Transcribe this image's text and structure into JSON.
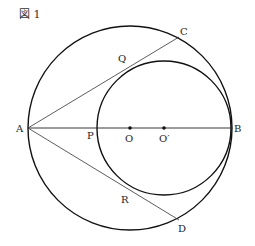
{
  "figure": {
    "title": "図 1",
    "colors": {
      "stroke": "#111111",
      "text": "#222222",
      "background": "#ffffff"
    },
    "big_circle": {
      "cx": 130,
      "cy": 128,
      "r": 102
    },
    "small_circle": {
      "cx": 164,
      "cy": 128,
      "r": 67
    },
    "points": {
      "A": {
        "label": "A",
        "x": 28,
        "y": 128
      },
      "B": {
        "label": "B",
        "x": 231,
        "y": 128
      },
      "C": {
        "label": "C",
        "x": 179,
        "y": 37
      },
      "D": {
        "label": "D",
        "x": 179,
        "y": 220
      },
      "P": {
        "label": "P",
        "x": 97,
        "y": 128
      },
      "Q": {
        "label": "Q",
        "x": 127,
        "y": 62
      },
      "R": {
        "label": "R",
        "x": 127,
        "y": 194
      },
      "O": {
        "label": "O",
        "x": 130,
        "y": 128
      },
      "O2": {
        "label": "O′",
        "x": 164,
        "y": 128
      }
    }
  }
}
